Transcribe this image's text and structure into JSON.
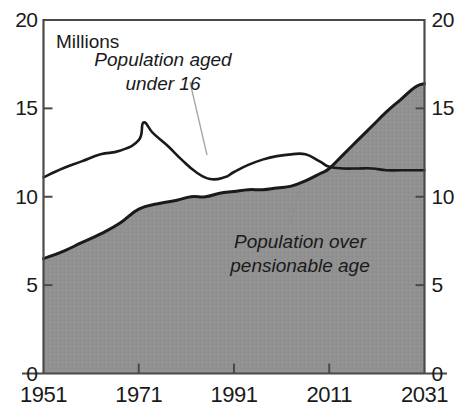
{
  "chart_data": {
    "type": "area",
    "title": "",
    "subtitle": "",
    "units_label": "Millions",
    "xlabel": "",
    "ylabel": "",
    "xlim": [
      1951,
      2031
    ],
    "ylim": [
      0,
      20
    ],
    "x_ticks": [
      "1951",
      "1971",
      "1991",
      "2011",
      "2031"
    ],
    "x_tick_values": [
      1951,
      1971,
      1991,
      2011,
      2031
    ],
    "y_ticks": [
      "0",
      "5",
      "10",
      "15",
      "20"
    ],
    "y_tick_values": [
      0,
      5,
      10,
      15,
      20
    ],
    "grid": false,
    "legend_position": "inline-annotations",
    "left_axis_ticks": [
      "20",
      "15",
      "10",
      "5",
      "0"
    ],
    "right_axis_ticks": [
      "20",
      "15",
      "10",
      "5",
      "0"
    ],
    "colors": {
      "area_fill": "#919191",
      "line": "#1a1a1a",
      "axis": "#4a4a4a",
      "background": "#ffffff",
      "leader_line": "#9a9a9a"
    },
    "series": [
      {
        "name": "Population aged under 16",
        "style": "line",
        "annotation": {
          "line1": "Population aged",
          "line2": "under 16",
          "x": 163,
          "y": 62
        },
        "x": [
          1951,
          1955,
          1959,
          1963,
          1967,
          1971,
          1972,
          1974,
          1977,
          1980,
          1983,
          1986,
          1989,
          1991,
          1994,
          1997,
          2000,
          2003,
          2006,
          2009,
          2011,
          2014,
          2017,
          2020,
          2023,
          2026,
          2031
        ],
        "values": [
          11.1,
          11.6,
          12.0,
          12.4,
          12.6,
          13.2,
          14.2,
          13.6,
          12.9,
          12.1,
          11.4,
          11.0,
          11.1,
          11.4,
          11.8,
          12.1,
          12.3,
          12.4,
          12.4,
          12.0,
          11.7,
          11.6,
          11.6,
          11.6,
          11.5,
          11.5,
          11.5
        ]
      },
      {
        "name": "Population over pensionable age",
        "style": "filled-area",
        "annotation": {
          "line1": "Population over",
          "line2": "pensionable age",
          "x": 300,
          "y": 244
        },
        "x": [
          1951,
          1955,
          1959,
          1963,
          1967,
          1971,
          1975,
          1979,
          1982,
          1985,
          1988,
          1991,
          1994,
          1997,
          2000,
          2003,
          2006,
          2009,
          2011,
          2014,
          2017,
          2020,
          2023,
          2026,
          2029,
          2031
        ],
        "values": [
          6.5,
          6.9,
          7.4,
          7.9,
          8.5,
          9.3,
          9.6,
          9.8,
          10.0,
          10.0,
          10.2,
          10.3,
          10.4,
          10.4,
          10.5,
          10.6,
          10.9,
          11.3,
          11.6,
          12.4,
          13.2,
          14.0,
          14.8,
          15.5,
          16.2,
          16.4
        ]
      }
    ],
    "crossover": {
      "x": 2011,
      "y": 11.6
    }
  }
}
